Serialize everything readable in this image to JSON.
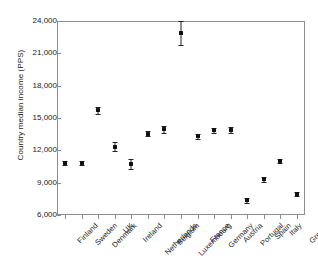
{
  "chart_data": {
    "type": "scatter",
    "title": "",
    "xlabel": "",
    "ylabel": "Country median income (PPS)",
    "ylim": [
      6000,
      24000
    ],
    "yticks": [
      6000,
      9000,
      12000,
      15000,
      18000,
      21000,
      24000
    ],
    "ytick_labels": [
      "6,000",
      "9,000",
      "12,000",
      "15,000",
      "18,000",
      "21,000",
      "24,000"
    ],
    "grid": false,
    "legend": null,
    "error_bars": "vertical",
    "categories": [
      "Finland",
      "Sweden",
      "Denmark",
      "UK",
      "Ireland",
      "Netherlands",
      "Belgium",
      "Luxembourg",
      "France",
      "Germany",
      "Austria",
      "Portugal",
      "Spain",
      "Italy",
      "Greece"
    ],
    "values": [
      10850,
      10800,
      15700,
      12350,
      10700,
      13550,
      13950,
      22900,
      13300,
      13850,
      13900,
      7350,
      9300,
      11000,
      7950
    ],
    "errors": [
      180,
      170,
      310,
      380,
      450,
      260,
      300,
      1100,
      210,
      230,
      290,
      200,
      230,
      220,
      230
    ]
  }
}
